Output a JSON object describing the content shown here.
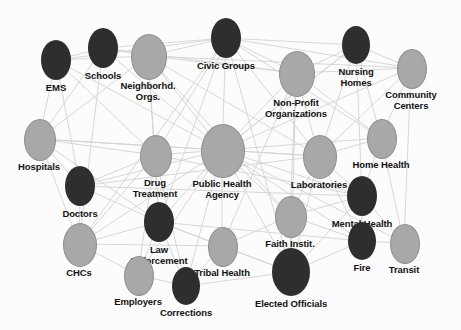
{
  "diagram": {
    "type": "node-link-network",
    "background_color": "#fcfcfc",
    "edge_color": "#d2d2d2",
    "node_dark_color": "#2e2e2e",
    "node_light_color": "#a8a8a8",
    "node_light_stroke": "#8f8f8f",
    "label_color": "#121212",
    "width": 461,
    "height": 330
  },
  "legend": {
    "dark_meaning": "dark-node",
    "light_meaning": "light-node"
  },
  "nodes": [
    {
      "id": "ems",
      "label": "EMS",
      "cx": 56,
      "cy": 60,
      "rx": 15,
      "ry": 20,
      "shade": "dark",
      "label_dy": 22,
      "label_w": 70
    },
    {
      "id": "schools",
      "label": "Schools",
      "cx": 103,
      "cy": 48,
      "rx": 15,
      "ry": 20,
      "shade": "dark",
      "label_dy": 22,
      "label_w": 70
    },
    {
      "id": "neighborhood",
      "label": "Neighborhd.\nOrgs.",
      "cx": 148,
      "cy": 56,
      "rx": 17,
      "ry": 22,
      "shade": "light",
      "label_dy": 24,
      "label_w": 80
    },
    {
      "id": "civic",
      "label": "Civic Groups",
      "cx": 226,
      "cy": 38,
      "rx": 15,
      "ry": 20,
      "shade": "dark",
      "label_dy": 22,
      "label_w": 80
    },
    {
      "id": "nonprofit",
      "label": "Non-Profit\nOrganizations",
      "cx": 296,
      "cy": 73,
      "rx": 17,
      "ry": 22,
      "shade": "light",
      "label_dy": 24,
      "label_w": 90
    },
    {
      "id": "nursing",
      "label": "Nursing\nHomes",
      "cx": 356,
      "cy": 45,
      "rx": 14,
      "ry": 19,
      "shade": "dark",
      "label_dy": 21,
      "label_w": 70
    },
    {
      "id": "community",
      "label": "Community\nCenters",
      "cx": 411,
      "cy": 68,
      "rx": 14,
      "ry": 19,
      "shade": "light",
      "label_dy": 21,
      "label_w": 80
    },
    {
      "id": "hospitals",
      "label": "Hospitals",
      "cx": 39,
      "cy": 139,
      "rx": 15,
      "ry": 20,
      "shade": "light",
      "label_dy": 22,
      "label_w": 76
    },
    {
      "id": "drugtx",
      "label": "Drug\nTreatment",
      "cx": 155,
      "cy": 155,
      "rx": 15,
      "ry": 20,
      "shade": "light",
      "label_dy": 22,
      "label_w": 80
    },
    {
      "id": "pha",
      "label": "Public Health\nAgency",
      "cx": 222,
      "cy": 150,
      "rx": 21,
      "ry": 26,
      "shade": "light",
      "label_dy": 28,
      "label_w": 96
    },
    {
      "id": "labs",
      "label": "Laboratories",
      "cx": 319,
      "cy": 156,
      "rx": 16,
      "ry": 21,
      "shade": "light",
      "label_dy": 23,
      "label_w": 84
    },
    {
      "id": "homehealth",
      "label": "Home Health",
      "cx": 381,
      "cy": 138,
      "rx": 14,
      "ry": 19,
      "shade": "light",
      "label_dy": 21,
      "label_w": 84
    },
    {
      "id": "doctors",
      "label": "Doctors",
      "cx": 80,
      "cy": 186,
      "rx": 15,
      "ry": 20,
      "shade": "dark",
      "label_dy": 22,
      "label_w": 70
    },
    {
      "id": "mental",
      "label": "Mental Health",
      "cx": 362,
      "cy": 196,
      "rx": 15,
      "ry": 20,
      "shade": "dark",
      "label_dy": 22,
      "label_w": 90
    },
    {
      "id": "law",
      "label": "Law\nEnforcement",
      "cx": 159,
      "cy": 222,
      "rx": 15,
      "ry": 20,
      "shade": "dark",
      "label_dy": 22,
      "label_w": 88
    },
    {
      "id": "faith",
      "label": "Faith Instit.",
      "cx": 290,
      "cy": 216,
      "rx": 15,
      "ry": 20,
      "shade": "light",
      "label_dy": 22,
      "label_w": 78
    },
    {
      "id": "chcs",
      "label": "CHCs",
      "cx": 79,
      "cy": 244,
      "rx": 16,
      "ry": 21,
      "shade": "light",
      "label_dy": 23,
      "label_w": 66
    },
    {
      "id": "tribal",
      "label": "Tribal Health",
      "cx": 222,
      "cy": 246,
      "rx": 14,
      "ry": 19,
      "shade": "light",
      "label_dy": 21,
      "label_w": 82
    },
    {
      "id": "fire",
      "label": "Fire",
      "cx": 362,
      "cy": 241,
      "rx": 14,
      "ry": 19,
      "shade": "dark",
      "label_dy": 21,
      "label_w": 56
    },
    {
      "id": "transit",
      "label": "Transit",
      "cx": 404,
      "cy": 243,
      "rx": 14,
      "ry": 19,
      "shade": "light",
      "label_dy": 21,
      "label_w": 62
    },
    {
      "id": "employers",
      "label": "Employers",
      "cx": 138,
      "cy": 275,
      "rx": 14,
      "ry": 19,
      "shade": "light",
      "label_dy": 21,
      "label_w": 78
    },
    {
      "id": "corrections",
      "label": "Corrections",
      "cx": 186,
      "cy": 286,
      "rx": 14,
      "ry": 19,
      "shade": "dark",
      "label_dy": 21,
      "label_w": 80
    },
    {
      "id": "elected",
      "label": "Elected Officials",
      "cx": 291,
      "cy": 272,
      "rx": 19,
      "ry": 24,
      "shade": "dark",
      "label_dy": 26,
      "label_w": 100
    }
  ],
  "edges": [
    [
      "ems",
      "schools"
    ],
    [
      "ems",
      "neighborhood"
    ],
    [
      "ems",
      "hospitals"
    ],
    [
      "ems",
      "pha"
    ],
    [
      "ems",
      "doctors"
    ],
    [
      "ems",
      "civic"
    ],
    [
      "ems",
      "drugtx"
    ],
    [
      "schools",
      "neighborhood"
    ],
    [
      "schools",
      "civic"
    ],
    [
      "schools",
      "pha"
    ],
    [
      "schools",
      "nonprofit"
    ],
    [
      "schools",
      "chcs"
    ],
    [
      "schools",
      "hospitals"
    ],
    [
      "neighborhood",
      "civic"
    ],
    [
      "neighborhood",
      "nonprofit"
    ],
    [
      "neighborhood",
      "pha"
    ],
    [
      "neighborhood",
      "drugtx"
    ],
    [
      "neighborhood",
      "hospitals"
    ],
    [
      "neighborhood",
      "law"
    ],
    [
      "neighborhood",
      "community"
    ],
    [
      "neighborhood",
      "labs"
    ],
    [
      "neighborhood",
      "faith"
    ],
    [
      "civic",
      "nonprofit"
    ],
    [
      "civic",
      "pha"
    ],
    [
      "civic",
      "nursing"
    ],
    [
      "civic",
      "community"
    ],
    [
      "civic",
      "drugtx"
    ],
    [
      "civic",
      "law"
    ],
    [
      "civic",
      "chcs"
    ],
    [
      "civic",
      "elected"
    ],
    [
      "civic",
      "homehealth"
    ],
    [
      "civic",
      "labs"
    ],
    [
      "nonprofit",
      "nursing"
    ],
    [
      "nonprofit",
      "community"
    ],
    [
      "nonprofit",
      "pha"
    ],
    [
      "nonprofit",
      "labs"
    ],
    [
      "nonprofit",
      "homehealth"
    ],
    [
      "nonprofit",
      "faith"
    ],
    [
      "nonprofit",
      "elected"
    ],
    [
      "nonprofit",
      "tribal"
    ],
    [
      "nursing",
      "community"
    ],
    [
      "nursing",
      "homehealth"
    ],
    [
      "nursing",
      "pha"
    ],
    [
      "nursing",
      "labs"
    ],
    [
      "nursing",
      "mental"
    ],
    [
      "community",
      "homehealth"
    ],
    [
      "community",
      "transit"
    ],
    [
      "community",
      "labs"
    ],
    [
      "hospitals",
      "doctors"
    ],
    [
      "hospitals",
      "pha"
    ],
    [
      "hospitals",
      "drugtx"
    ],
    [
      "hospitals",
      "chcs"
    ],
    [
      "hospitals",
      "labs"
    ],
    [
      "hospitals",
      "law"
    ],
    [
      "drugtx",
      "pha"
    ],
    [
      "drugtx",
      "law"
    ],
    [
      "drugtx",
      "doctors"
    ],
    [
      "drugtx",
      "chcs"
    ],
    [
      "drugtx",
      "corrections"
    ],
    [
      "drugtx",
      "mental"
    ],
    [
      "drugtx",
      "employers"
    ],
    [
      "pha",
      "labs"
    ],
    [
      "pha",
      "homehealth"
    ],
    [
      "pha",
      "doctors"
    ],
    [
      "pha",
      "law"
    ],
    [
      "pha",
      "chcs"
    ],
    [
      "pha",
      "faith"
    ],
    [
      "pha",
      "tribal"
    ],
    [
      "pha",
      "elected"
    ],
    [
      "pha",
      "mental"
    ],
    [
      "pha",
      "fire"
    ],
    [
      "pha",
      "transit"
    ],
    [
      "pha",
      "employers"
    ],
    [
      "pha",
      "corrections"
    ],
    [
      "pha",
      "community"
    ],
    [
      "pha",
      "nursing"
    ],
    [
      "labs",
      "homehealth"
    ],
    [
      "labs",
      "mental"
    ],
    [
      "labs",
      "faith"
    ],
    [
      "labs",
      "doctors"
    ],
    [
      "labs",
      "elected"
    ],
    [
      "labs",
      "fire"
    ],
    [
      "homehealth",
      "mental"
    ],
    [
      "homehealth",
      "transit"
    ],
    [
      "doctors",
      "chcs"
    ],
    [
      "doctors",
      "law"
    ],
    [
      "doctors",
      "mental"
    ],
    [
      "mental",
      "fire"
    ],
    [
      "mental",
      "faith"
    ],
    [
      "mental",
      "elected"
    ],
    [
      "mental",
      "transit"
    ],
    [
      "law",
      "chcs"
    ],
    [
      "law",
      "corrections"
    ],
    [
      "law",
      "employers"
    ],
    [
      "law",
      "tribal"
    ],
    [
      "law",
      "fire"
    ],
    [
      "law",
      "elected"
    ],
    [
      "faith",
      "tribal"
    ],
    [
      "faith",
      "elected"
    ],
    [
      "faith",
      "fire"
    ],
    [
      "chcs",
      "employers"
    ],
    [
      "chcs",
      "tribal"
    ],
    [
      "tribal",
      "corrections"
    ],
    [
      "tribal",
      "elected"
    ],
    [
      "fire",
      "transit"
    ],
    [
      "fire",
      "elected"
    ],
    [
      "employers",
      "corrections"
    ],
    [
      "corrections",
      "elected"
    ]
  ]
}
